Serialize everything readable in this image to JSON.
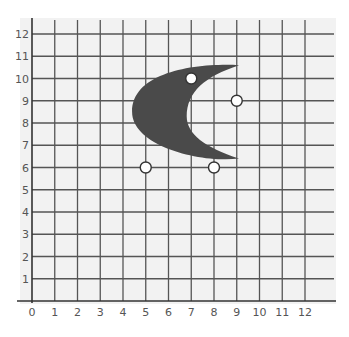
{
  "diagram": {
    "type": "coordinate-grid",
    "x_axis": {
      "min": 0,
      "max": 12,
      "tick_labels": [
        "0",
        "1",
        "2",
        "3",
        "4",
        "5",
        "6",
        "7",
        "8",
        "9",
        "10",
        "11",
        "12"
      ]
    },
    "y_axis": {
      "min": 0,
      "max": 12,
      "tick_labels": [
        "1",
        "2",
        "3",
        "4",
        "5",
        "6",
        "7",
        "8",
        "9",
        "10",
        "11",
        "12"
      ]
    },
    "shape": {
      "name": "crescent",
      "color": "#4a4a4a",
      "outer_curve": {
        "upper_tip": [
          9.1,
          10.6
        ],
        "leftmost": [
          4.4,
          8.5
        ],
        "lower_tip": [
          9.1,
          6.4
        ]
      },
      "inner_curve": {
        "leftmost": [
          6.8,
          8.3
        ]
      }
    },
    "points": [
      {
        "label": "circle-1",
        "x": 7,
        "y": 10
      },
      {
        "label": "circle-2",
        "x": 9,
        "y": 9
      },
      {
        "label": "circle-3",
        "x": 5,
        "y": 6
      },
      {
        "label": "circle-4",
        "x": 8,
        "y": 6
      }
    ],
    "colors": {
      "background": "#f2f2f2",
      "grid_line": "#555555",
      "axis_line": "#333333",
      "label": "#555555",
      "point_fill": "#ffffff",
      "point_stroke": "#333333"
    }
  }
}
